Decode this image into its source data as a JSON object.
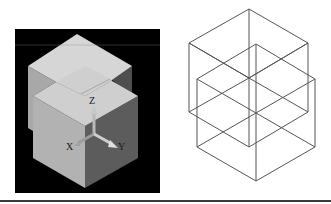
{
  "figure": {
    "left_view": {
      "type": "shaded-solid",
      "background": "#000000",
      "face_colors": {
        "top": "#d6d6d6",
        "left": "#b2b2b2",
        "right": "#5c5c5c"
      },
      "axis_labels": {
        "x": "X",
        "y": "Y",
        "z": "Z"
      }
    },
    "right_view": {
      "type": "wireframe",
      "stroke": "#555555"
    }
  }
}
